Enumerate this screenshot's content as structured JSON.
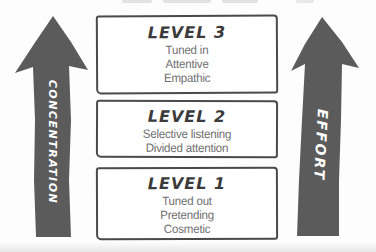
{
  "diagram": {
    "levels": [
      {
        "title": "LEVEL 3",
        "lines": [
          "Tuned in",
          "Attentive",
          "Empathic"
        ]
      },
      {
        "title": "LEVEL 2",
        "lines": [
          "Selective listening",
          "Divided attention"
        ]
      },
      {
        "title": "LEVEL 1",
        "lines": [
          "Tuned out",
          "Pretending",
          "Cosmetic"
        ]
      }
    ],
    "arrows": {
      "left": {
        "label": "CONCENTRATION",
        "direction": "up"
      },
      "right": {
        "label": "EFFORT",
        "direction": "up"
      }
    },
    "colors": {
      "arrow_fill": "#5b5b5b",
      "box_border": "#4a4a4a",
      "level_title_text": "#3b3b3b",
      "level_body_text": "#6f6f6f",
      "arrow_label_text": "#ffffff"
    }
  }
}
